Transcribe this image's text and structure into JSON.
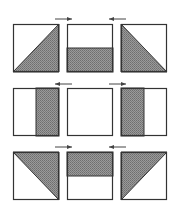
{
  "diagram": {
    "title": "",
    "colors": {
      "stroke": "#333333",
      "fill": "#8c8c8c",
      "background": "#ffffff",
      "arrow": "#444444"
    },
    "rows": [
      {
        "panels": [
          {
            "id": "r1c1",
            "shape": "triangle",
            "shaded": "lower-right",
            "diagonal": "bottom-left-to-top-right"
          },
          {
            "id": "r1c2",
            "shape": "half",
            "shaded": "bottom"
          },
          {
            "id": "r1c3",
            "shape": "triangle",
            "shaded": "lower-left",
            "diagonal": "top-left-to-bottom-right"
          }
        ],
        "arrows": [
          {
            "between": "r1c1-r1c2",
            "direction": "right"
          },
          {
            "between": "r1c2-r1c3",
            "direction": "left"
          }
        ]
      },
      {
        "panels": [
          {
            "id": "r2c1",
            "shape": "half",
            "shaded": "right"
          },
          {
            "id": "r2c2",
            "shape": "empty",
            "shaded": "none"
          },
          {
            "id": "r2c3",
            "shape": "half",
            "shaded": "left"
          }
        ],
        "arrows": [
          {
            "between": "r2c1-r2c2",
            "direction": "left"
          },
          {
            "between": "r2c2-r2c3",
            "direction": "right"
          }
        ]
      },
      {
        "panels": [
          {
            "id": "r3c1",
            "shape": "triangle",
            "shaded": "upper-right",
            "diagonal": "top-left-to-bottom-right"
          },
          {
            "id": "r3c2",
            "shape": "half",
            "shaded": "top"
          },
          {
            "id": "r3c3",
            "shape": "triangle",
            "shaded": "upper-left",
            "diagonal": "bottom-left-to-top-right"
          }
        ],
        "arrows": [
          {
            "between": "r3c1-r3c2",
            "direction": "right"
          },
          {
            "between": "r3c2-r3c3",
            "direction": "left"
          }
        ]
      }
    ]
  }
}
